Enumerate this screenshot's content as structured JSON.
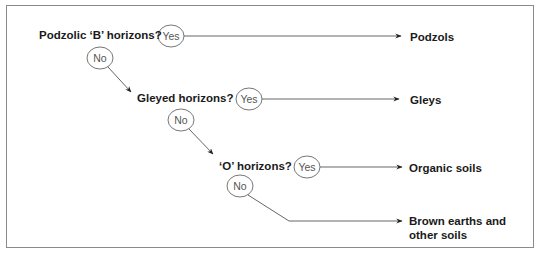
{
  "diagram": {
    "type": "decision-flowchart",
    "questions": [
      {
        "label": "Podzolic ‘B’ horizons?",
        "yes": "Yes",
        "no": "No"
      },
      {
        "label": "Gleyed horizons?",
        "yes": "Yes",
        "no": "No"
      },
      {
        "label": "‘O’ horizons?",
        "yes": "Yes",
        "no": "No"
      }
    ],
    "results": [
      {
        "label": "Podzols"
      },
      {
        "label": "Gleys"
      },
      {
        "label": "Organic soils"
      },
      {
        "label": "Brown earths and"
      },
      {
        "label": "other soils"
      }
    ],
    "colors": {
      "line": "#555555",
      "text": "#1a1a1a",
      "circle": "#666666",
      "border": "#8a8a8a"
    }
  }
}
